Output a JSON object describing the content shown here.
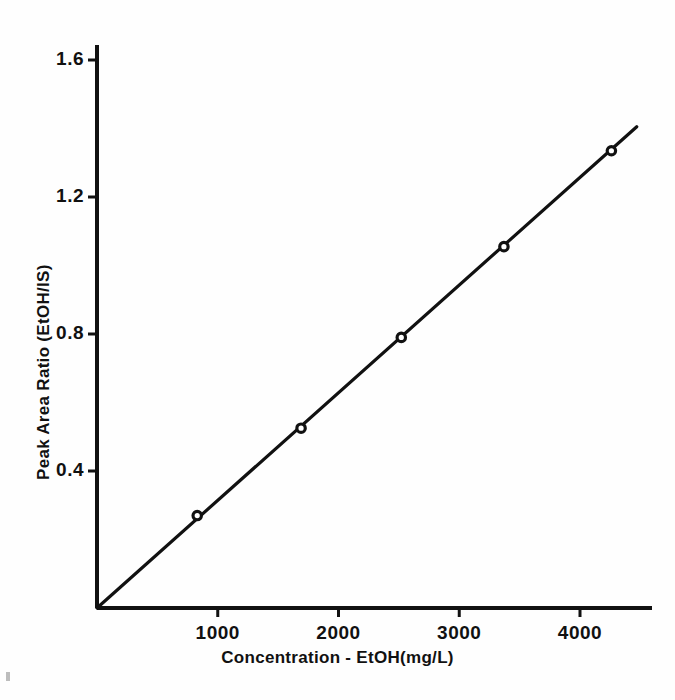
{
  "chart_data": {
    "type": "line",
    "title": "",
    "subtitle": "",
    "xlabel": "Concentration - EtOH(mg/L)",
    "ylabel": "Peak Area Ratio (EtOH/IS)",
    "xlim": [
      0,
      4550
    ],
    "ylim": [
      0,
      1.68
    ],
    "grid": false,
    "legend": null,
    "legend_position": "none",
    "xticks": [
      1000,
      2000,
      3000,
      4000
    ],
    "xtick_labels": [
      "1000",
      "2000",
      "3000",
      "4000"
    ],
    "yticks": [
      0.4,
      0.8,
      1.2,
      1.6
    ],
    "ytick_labels": [
      "0.4",
      "0.8",
      "1.2",
      "1.6"
    ],
    "marker": "open-circle",
    "line_color": "#111111",
    "marker_color": "#111111",
    "series": [
      {
        "name": "EtOH calibration",
        "x": [
          830,
          1690,
          2520,
          3370,
          4260
        ],
        "y": [
          0.27,
          0.525,
          0.79,
          1.055,
          1.335
        ]
      }
    ],
    "fit_line": {
      "from": [
        0,
        0.0
      ],
      "to": [
        4470,
        1.405
      ],
      "description": "linear calibration line through origin"
    },
    "annotations": []
  },
  "axes": {
    "x_axis_name": "x-axis",
    "y_axis_name": "y-axis"
  }
}
